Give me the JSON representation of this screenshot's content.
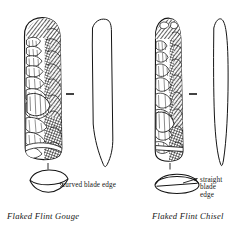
{
  "figure": {
    "name": "flaked-flint-tools-plate",
    "background_color": "#ffffff",
    "ink_color": "#151515",
    "description_alt": "Line drawings of two flaked flint stone tools shown in face view and side profile with cross-section diagrams"
  },
  "specimens": [
    {
      "id": "gouge",
      "caption": "Flaked Flint Gouge",
      "annotation": "curved blade edge",
      "views": [
        "face-view",
        "side-profile",
        "cross-section"
      ],
      "cross_section_shape": "lens-with-curved-edge",
      "blade_edge": "curved"
    },
    {
      "id": "chisel",
      "caption": "Flaked Flint Chisel",
      "annotation_lines": [
        "straight",
        "blade",
        "edge"
      ],
      "annotation": "straight blade edge",
      "views": [
        "face-view",
        "side-profile",
        "cross-section"
      ],
      "cross_section_shape": "flattened-ellipse-with-straight-edge",
      "blade_edge": "straight"
    }
  ],
  "scale_marks": {
    "count": 2,
    "label": "scale-dash"
  }
}
